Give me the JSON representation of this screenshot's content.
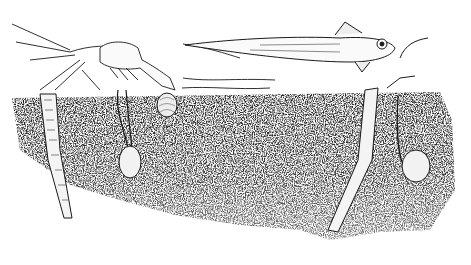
{
  "image": {
    "description": "Black-and-white pen illustration of a seafloor scene: a shrimp and a fish (grenadier) swimming above sediment, with tube-dwelling worms and burrowing clams in the speckled substrate.",
    "subjects": [
      "shrimp",
      "fish",
      "small shrimp",
      "tube worm",
      "clam",
      "clam",
      "tube worm",
      "clam"
    ],
    "colors": {
      "background": "#ffffff",
      "ink": "#1a1a1a",
      "sediment": "#3a3a3a"
    }
  }
}
